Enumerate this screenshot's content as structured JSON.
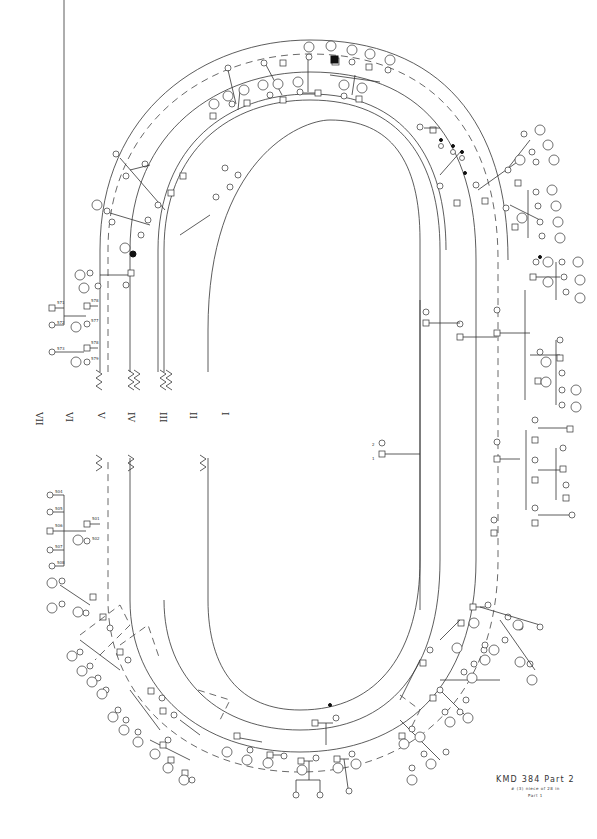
{
  "caption": {
    "title": "KMD 384 Part 2",
    "line1": "# (3) niece of 28 in",
    "line2": "Part 1"
  },
  "generations": [
    "VII",
    "VI",
    "V",
    "IV",
    "III",
    "II",
    "I"
  ],
  "colors": {
    "line": "#333333",
    "background": "#ffffff",
    "affected": "#111111"
  },
  "founders": {
    "male_label": "1",
    "female_label": "2"
  },
  "gen2": [
    "11",
    "12",
    "13",
    "14",
    "15",
    "16"
  ],
  "gen3_left": [
    "81",
    "82"
  ],
  "gen4_left": [
    "151",
    "152",
    "153",
    "154",
    "155",
    "156",
    "157",
    "158",
    "159",
    "160",
    "161",
    "162",
    "163"
  ],
  "gen5_left": [
    "565",
    "566",
    "567",
    "568",
    "569",
    "570",
    "571",
    "572",
    "573",
    "574",
    "575",
    "576",
    "577",
    "578",
    "579"
  ],
  "gen5_bottom_left": [
    "501",
    "502",
    "503",
    "504",
    "505",
    "506",
    "507",
    "508",
    "509",
    "510",
    "511",
    "512",
    "513",
    "514",
    "515",
    "516",
    "517",
    "518",
    "519",
    "520",
    "521",
    "522",
    "523",
    "524",
    "525",
    "526"
  ],
  "gen5_right": [
    "527",
    "528",
    "529",
    "530",
    "531",
    "532",
    "533",
    "534",
    "535",
    "536",
    "537",
    "538",
    "539",
    "540",
    "541",
    "542",
    "543",
    "544",
    "545",
    "546",
    "547",
    "548",
    "549",
    "550",
    "551",
    "552",
    "553",
    "554",
    "555",
    "556",
    "557",
    "558",
    "559",
    "560",
    "561",
    "562",
    "563",
    "564"
  ],
  "gen6_circled": [
    "562",
    "563",
    "564",
    "565",
    "566",
    "567",
    "568",
    "569",
    "570",
    "571",
    "572",
    "573",
    "574",
    "575",
    "576",
    "577",
    "578",
    "579",
    "580",
    "581"
  ],
  "top_cluster_labels": [
    "547",
    "548",
    "549",
    "550",
    "551",
    "552",
    "553",
    "554",
    "555",
    "556",
    "557",
    "558",
    "559",
    "560",
    "561"
  ],
  "right_stack_labels": [
    "541",
    "542",
    "543",
    "544",
    "545",
    "546"
  ],
  "bottom_cluster_labels": [
    "511",
    "512",
    "513",
    "514",
    "515",
    "516",
    "517",
    "518",
    "519",
    "520",
    "521",
    "522",
    "523",
    "524"
  ],
  "left_stack_top": [
    "571",
    "572",
    "573",
    "574",
    "575",
    "576",
    "577",
    "578",
    "579"
  ],
  "left_stack_bottom": [
    "504",
    "505",
    "506",
    "507",
    "508"
  ]
}
